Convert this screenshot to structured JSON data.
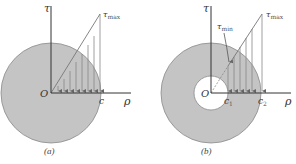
{
  "figure": {
    "colors": {
      "section_fill": "#c4c4c4",
      "section_stroke": "#8a8a8a",
      "axis": "#333333",
      "arrow": "#777777",
      "background": "#ffffff"
    },
    "panel_a": {
      "caption": "(a)",
      "axis_vertical_label": "τ",
      "axis_horizontal_label": "ρ",
      "origin_label": "O",
      "radius_label": "c",
      "tau_max_label": "τ",
      "tau_max_sub": "max",
      "shape": "solid circular section"
    },
    "panel_b": {
      "caption": "(b)",
      "axis_vertical_label": "τ",
      "axis_horizontal_label": "ρ",
      "origin_label": "O",
      "inner_radius_label": "c",
      "inner_radius_sub": "1",
      "outer_radius_label": "c",
      "outer_radius_sub": "2",
      "tau_max_label": "τ",
      "tau_max_sub": "max",
      "tau_min_label": "τ",
      "tau_min_sub": "min",
      "shape": "hollow circular section"
    }
  }
}
